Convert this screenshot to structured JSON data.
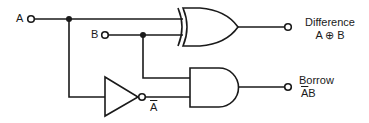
{
  "diagram": {
    "inputs": [
      {
        "id": "A",
        "label": "A"
      },
      {
        "id": "B",
        "label": "B"
      }
    ],
    "gates": [
      {
        "id": "xor",
        "type": "XOR",
        "inputs": [
          "A",
          "B"
        ],
        "output": "Difference"
      },
      {
        "id": "not",
        "type": "NOT",
        "inputs": [
          "A"
        ],
        "output": "A_bar"
      },
      {
        "id": "and",
        "type": "AND",
        "inputs": [
          "B",
          "A_bar"
        ],
        "output": "Borrow"
      }
    ],
    "outputs": [
      {
        "id": "difference",
        "label": "Difference",
        "expression": "A ⊕ B"
      },
      {
        "id": "borrow",
        "label": "Borrow",
        "expression_bar": "A",
        "expression_rest": "B"
      }
    ],
    "inverter_output_label": "A"
  }
}
